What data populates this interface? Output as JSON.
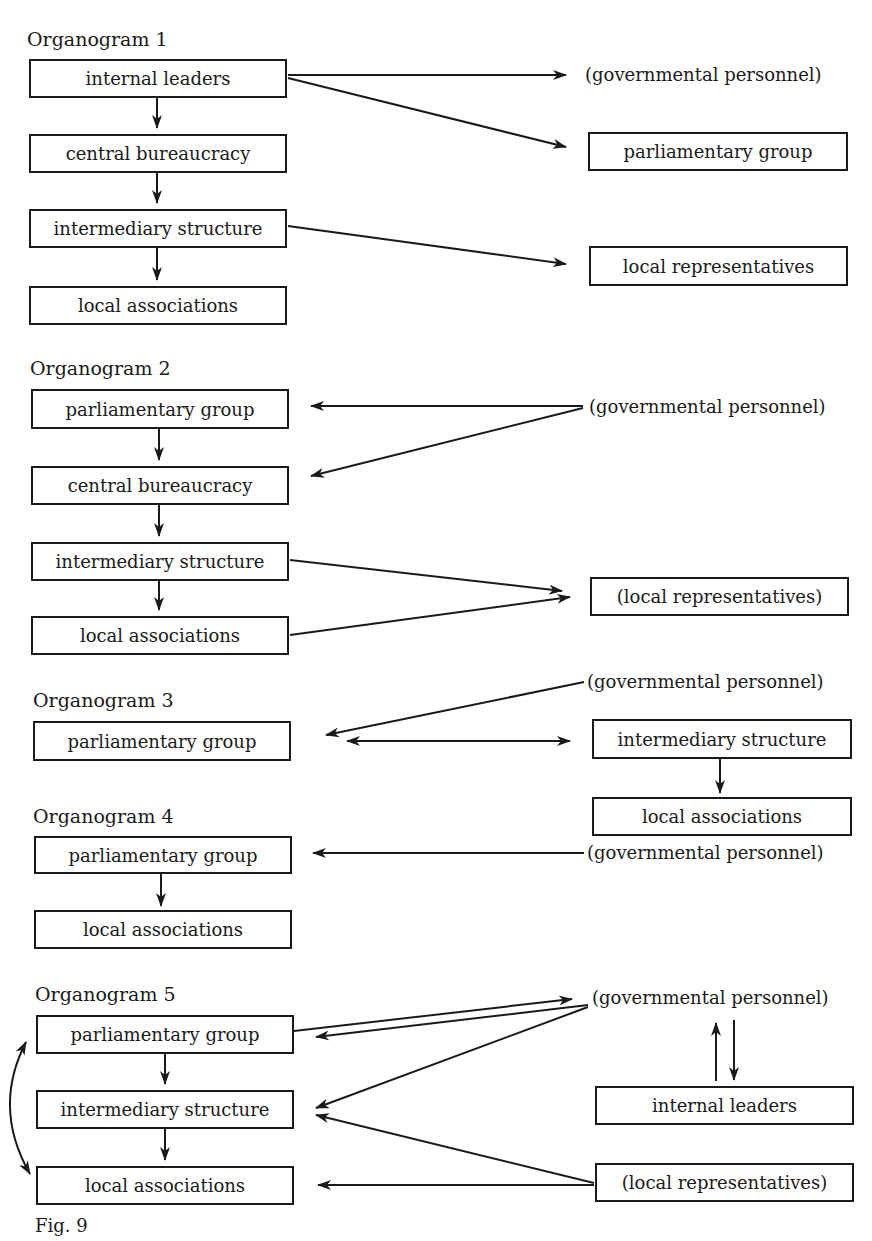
{
  "figure": {
    "caption": "Fig. 9",
    "organograms": [
      {
        "title": "Organogram 1",
        "left_column": [
          "internal leaders",
          "central bureaucracy",
          "intermediary structure",
          "local associations"
        ],
        "right_column": [
          "(governmental personnel)",
          "parliamentary group",
          "local representatives"
        ],
        "edges": [
          {
            "from": "internal leaders",
            "to": "central bureaucracy"
          },
          {
            "from": "central bureaucracy",
            "to": "intermediary structure"
          },
          {
            "from": "intermediary structure",
            "to": "local associations"
          },
          {
            "from": "internal leaders",
            "to": "(governmental personnel)"
          },
          {
            "from": "internal leaders",
            "to": "parliamentary group"
          },
          {
            "from": "intermediary structure",
            "to": "local representatives"
          }
        ]
      },
      {
        "title": "Organogram 2",
        "left_column": [
          "parliamentary group",
          "central bureaucracy",
          "intermediary structure",
          "local associations"
        ],
        "right_column": [
          "(governmental personnel)",
          "(local representatives)"
        ],
        "edges": [
          {
            "from": "parliamentary group",
            "to": "central bureaucracy"
          },
          {
            "from": "central bureaucracy",
            "to": "intermediary structure"
          },
          {
            "from": "intermediary structure",
            "to": "local associations"
          },
          {
            "from": "(governmental personnel)",
            "to": "parliamentary group"
          },
          {
            "from": "(governmental personnel)",
            "to": "central bureaucracy"
          },
          {
            "from": "intermediary structure",
            "to": "(local representatives)"
          },
          {
            "from": "local associations",
            "to": "(local representatives)"
          }
        ]
      },
      {
        "title": "Organogram 3",
        "left_column": [
          "parliamentary group"
        ],
        "right_column": [
          "(governmental personnel)",
          "intermediary structure",
          "local associations"
        ],
        "edges": [
          {
            "from": "(governmental personnel)",
            "to": "parliamentary group"
          },
          {
            "from": "parliamentary group",
            "to": "intermediary structure",
            "bidirectional": true
          },
          {
            "from": "intermediary structure",
            "to": "local associations"
          }
        ]
      },
      {
        "title": "Organogram 4",
        "left_column": [
          "parliamentary group",
          "local associations"
        ],
        "right_column": [
          "(governmental personnel)"
        ],
        "edges": [
          {
            "from": "(governmental personnel)",
            "to": "parliamentary group"
          },
          {
            "from": "parliamentary group",
            "to": "local associations"
          }
        ]
      },
      {
        "title": "Organogram 5",
        "left_column": [
          "parliamentary group",
          "intermediary structure",
          "local associations"
        ],
        "right_column": [
          "(governmental personnel)",
          "internal leaders",
          "(local representatives)"
        ],
        "edges": [
          {
            "from": "parliamentary group",
            "to": "intermediary structure"
          },
          {
            "from": "intermediary structure",
            "to": "local associations"
          },
          {
            "from": "parliamentary group",
            "to": "local associations",
            "bidirectional": true,
            "curved": true
          },
          {
            "from": "parliamentary group",
            "to": "(governmental personnel)"
          },
          {
            "from": "(governmental personnel)",
            "to": "parliamentary group"
          },
          {
            "from": "(governmental personnel)",
            "to": "intermediary structure"
          },
          {
            "from": "internal leaders",
            "to": "(governmental personnel)"
          },
          {
            "from": "(governmental personnel)",
            "to": "internal leaders"
          },
          {
            "from": "(local representatives)",
            "to": "intermediary structure"
          },
          {
            "from": "(local representatives)",
            "to": "local associations"
          }
        ]
      }
    ]
  },
  "colors": {
    "ink": "#1a1a1a",
    "paper": "#ffffff"
  }
}
